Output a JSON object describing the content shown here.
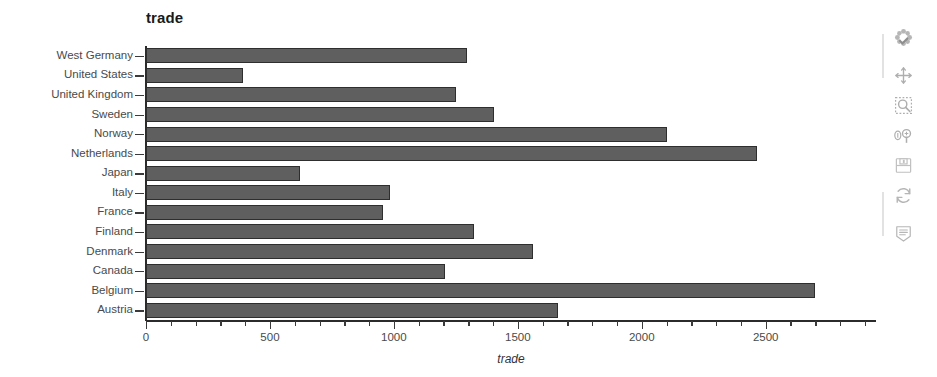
{
  "chart_data": {
    "type": "bar",
    "orientation": "horizontal",
    "title": "trade",
    "xlabel": "trade",
    "ylabel": "",
    "xlim": [
      0,
      2945
    ],
    "ylim": null,
    "grid": false,
    "legend": null,
    "bar_color": "#5f5f5f",
    "bar_edge_color": "#2e2e2e",
    "xticks": [
      0,
      500,
      1000,
      1500,
      2000,
      2500
    ],
    "xticklabels": [
      "0",
      "500",
      "1000",
      "1500",
      "2000",
      "2500"
    ],
    "minor_tick_step": 100,
    "categories": [
      "West Germany",
      "United States",
      "United Kingdom",
      "Sweden",
      "Norway",
      "Netherlands",
      "Japan",
      "Italy",
      "France",
      "Finland",
      "Denmark",
      "Canada",
      "Belgium",
      "Austria"
    ],
    "values": [
      1295,
      391,
      1250,
      1403,
      2100,
      2465,
      622,
      983,
      955,
      1325,
      1562,
      1205,
      2700,
      1663
    ]
  },
  "modebar": {
    "label": "Plotly modebar",
    "buttons": [
      {
        "name": "plotly-logo-icon",
        "title": "Produced with Plotly"
      },
      {
        "name": "pan-move-icon",
        "title": "Pan"
      },
      {
        "name": "zoom-select-box-icon",
        "title": "Box Zoom"
      },
      {
        "name": "zoom-in-out-icon",
        "title": "Zoom in / Zoom out"
      },
      {
        "name": "save-disk-icon",
        "title": "Download plot as png"
      },
      {
        "name": "autoscale-refresh-icon",
        "title": "Autoscale / Reset axes"
      },
      {
        "name": "toggle-data-panel-icon",
        "title": "Toggle data panel"
      }
    ]
  }
}
